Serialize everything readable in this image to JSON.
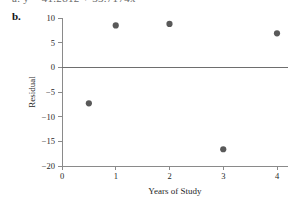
{
  "panel": {
    "letter": "b.",
    "clipped_equation_above": "a.  ŷ = 41.2812 + 33.7174x"
  },
  "chart_data": {
    "type": "scatter",
    "title": "",
    "xlabel": "Years of Study",
    "ylabel": "Residual",
    "xlim": [
      0,
      4.2
    ],
    "ylim": [
      -20,
      10
    ],
    "xticks": [
      0,
      1,
      2,
      3,
      4
    ],
    "xticklabels": [
      "0",
      "1",
      "2",
      "3",
      "4"
    ],
    "yticks": [
      10,
      5,
      0,
      -5,
      -10,
      -15,
      -20
    ],
    "yticklabels": [
      "10",
      "5",
      "0",
      "−5",
      "−10",
      "−15",
      "−20"
    ],
    "grid": false,
    "legend": null,
    "reference_lines": [
      {
        "name": "zero-residual-line",
        "orientation": "horizontal",
        "y": 0,
        "color": "#6e6e6e"
      }
    ],
    "series": [
      {
        "name": "Residuals",
        "marker": "filled-circle",
        "color": "#595959",
        "points": [
          {
            "x": 0.5,
            "y": -7.3
          },
          {
            "x": 1.0,
            "y": 8.5
          },
          {
            "x": 2.0,
            "y": 8.8
          },
          {
            "x": 3.0,
            "y": -16.6
          },
          {
            "x": 4.0,
            "y": 6.9
          }
        ]
      }
    ],
    "x": [
      0.5,
      1,
      2,
      3,
      4
    ],
    "values": [
      -7.3,
      8.5,
      8.8,
      -16.6,
      6.9
    ]
  },
  "colors": {
    "marker": "#595959",
    "axis": "#8a8a8a",
    "zero_line": "#6e6e6e",
    "text": "#1f1f1f",
    "background": "#ffffff"
  }
}
